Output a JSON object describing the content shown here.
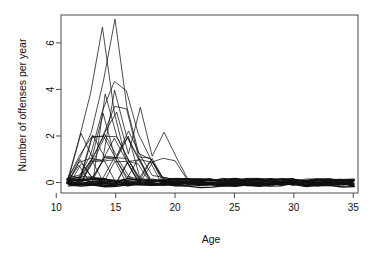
{
  "chart_data": {
    "type": "line",
    "title": "",
    "subtitle": "",
    "xlabel": "Age",
    "ylabel": "Number of offenses per year",
    "xlim": [
      10.4,
      35.4
    ],
    "ylim": [
      -0.45,
      7.2
    ],
    "xticks": [
      10,
      15,
      20,
      25,
      30,
      35
    ],
    "xtick_labels": [
      "10",
      "15",
      "20",
      "25",
      "30",
      "35"
    ],
    "yticks": [
      0,
      2,
      4,
      6
    ],
    "ytick_labels": [
      "0",
      "2",
      "4",
      "6"
    ],
    "grid": false,
    "legend": false,
    "legend_position": "none",
    "line_color": "#111111",
    "background_color": "#ffffff",
    "frame_color": "#4d4d4d",
    "note": "Spaghetti plot of individual offending trajectories; x = age in years, y = number of offenses per year, jittered slightly around integer values.",
    "x": [
      11,
      12,
      13,
      14,
      15,
      16,
      17,
      18,
      19,
      20,
      21,
      22,
      23,
      24,
      25,
      26,
      27,
      28,
      29,
      30,
      31,
      32,
      33,
      34,
      35
    ],
    "series": [
      {
        "name": "case-01",
        "values": [
          0.12,
          1.9,
          3.9,
          6.8,
          3.1,
          1.0,
          0.9,
          0.1,
          0.05,
          0.0,
          0.02,
          0.0,
          0.04,
          0.0,
          0.02,
          0.0,
          0.03,
          0.0,
          0.01,
          0.0,
          0.02,
          0.0,
          0.03,
          0.0,
          0.02
        ]
      },
      {
        "name": "case-02",
        "values": [
          0.08,
          0.9,
          2.0,
          4.2,
          6.9,
          3.2,
          1.1,
          0.9,
          0.1,
          0.05,
          0.0,
          0.02,
          0.0,
          0.03,
          0.0,
          0.01,
          0.0,
          0.02,
          0.0,
          0.03,
          0.0,
          0.02,
          0.0,
          0.01,
          0.0
        ]
      },
      {
        "name": "case-03",
        "values": [
          0.05,
          0.2,
          1.1,
          3.0,
          4.3,
          3.9,
          2.0,
          1.0,
          0.2,
          0.05,
          0.0,
          0.0,
          0.02,
          0.0,
          0.01,
          0.0,
          0.0,
          0.02,
          0.0,
          0.0,
          0.01,
          0.0,
          0.0,
          0.02,
          0.0
        ]
      },
      {
        "name": "case-04",
        "values": [
          0.0,
          1.0,
          1.8,
          1.9,
          3.2,
          3.1,
          1.0,
          1.0,
          0.05,
          0.0,
          0.0,
          0.01,
          0.0,
          0.0,
          0.02,
          0.0,
          0.0,
          0.0,
          0.01,
          0.0,
          0.0,
          0.0,
          0.02,
          0.0,
          0.0
        ]
      },
      {
        "name": "case-05",
        "values": [
          0.15,
          2.0,
          1.0,
          2.1,
          2.9,
          1.1,
          3.1,
          1.0,
          2.1,
          1.0,
          0.05,
          0.0,
          0.0,
          0.0,
          0.0,
          0.01,
          0.0,
          0.0,
          0.0,
          0.0,
          0.0,
          0.01,
          0.0,
          0.0,
          0.0
        ]
      },
      {
        "name": "case-06",
        "values": [
          0.0,
          0.1,
          2.0,
          2.0,
          1.0,
          2.0,
          1.0,
          0.9,
          1.0,
          0.9,
          0.1,
          0.0,
          0.0,
          0.0,
          0.0,
          0.0,
          0.0,
          0.0,
          0.0,
          0.0,
          0.0,
          0.0,
          0.0,
          0.0,
          0.0
        ]
      },
      {
        "name": "case-07",
        "values": [
          0.1,
          0.9,
          0.2,
          3.9,
          2.0,
          1.0,
          0.1,
          1.0,
          0.0,
          0.1,
          0.0,
          0.0,
          0.0,
          0.0,
          0.0,
          0.0,
          0.0,
          0.0,
          0.0,
          0.0,
          0.0,
          0.0,
          0.0,
          0.0,
          0.0
        ]
      },
      {
        "name": "case-08",
        "values": [
          0.0,
          0.1,
          1.0,
          1.0,
          4.0,
          2.0,
          1.0,
          0.1,
          0.0,
          0.0,
          0.0,
          0.0,
          0.0,
          0.0,
          0.0,
          0.0,
          0.0,
          0.0,
          0.0,
          0.0,
          0.0,
          0.0,
          0.0,
          0.0,
          0.0
        ]
      },
      {
        "name": "case-09",
        "values": [
          0.2,
          0.1,
          1.0,
          2.0,
          1.0,
          2.1,
          1.0,
          0.2,
          0.1,
          0.0,
          0.0,
          0.0,
          0.0,
          0.0,
          0.0,
          0.0,
          0.0,
          0.0,
          0.0,
          0.0,
          0.0,
          0.0,
          0.0,
          0.0,
          0.0
        ]
      },
      {
        "name": "case-10",
        "values": [
          0.0,
          0.9,
          1.1,
          1.0,
          2.0,
          1.0,
          0.1,
          1.0,
          0.0,
          0.0,
          0.0,
          0.0,
          0.0,
          0.0,
          0.0,
          0.0,
          0.0,
          0.0,
          0.0,
          0.0,
          0.0,
          0.0,
          0.0,
          0.0,
          0.0
        ]
      },
      {
        "name": "case-11",
        "values": [
          0.1,
          0.2,
          0.9,
          2.9,
          1.0,
          0.1,
          1.0,
          0.1,
          0.0,
          0.0,
          0.0,
          0.0,
          0.0,
          0.0,
          0.0,
          0.0,
          0.0,
          0.0,
          0.0,
          0.0,
          0.0,
          0.0,
          0.0,
          0.0,
          0.0
        ]
      },
      {
        "name": "case-12",
        "values": [
          0.0,
          1.0,
          0.1,
          1.0,
          1.1,
          1.0,
          0.1,
          0.0,
          0.1,
          0.0,
          0.0,
          0.0,
          0.0,
          0.0,
          0.0,
          0.0,
          0.0,
          0.0,
          0.0,
          0.0,
          0.0,
          0.0,
          0.0,
          0.0,
          0.0
        ]
      },
      {
        "name": "case-13",
        "values": [
          0.15,
          0.1,
          2.0,
          1.0,
          1.0,
          1.9,
          0.1,
          0.9,
          0.0,
          0.1,
          0.0,
          0.0,
          0.0,
          0.0,
          0.0,
          0.0,
          0.0,
          0.0,
          0.0,
          0.0,
          0.0,
          0.0,
          0.0,
          0.0,
          0.0
        ]
      },
      {
        "name": "case-14",
        "values": [
          0.0,
          0.1,
          0.9,
          2.0,
          2.0,
          1.0,
          0.0,
          0.1,
          0.0,
          0.0,
          0.0,
          0.0,
          0.0,
          0.0,
          0.0,
          0.0,
          0.0,
          0.0,
          0.0,
          0.0,
          0.0,
          0.0,
          0.0,
          0.0,
          0.0
        ]
      },
      {
        "name": "case-15",
        "values": [
          0.1,
          0.0,
          1.0,
          1.0,
          0.1,
          1.0,
          1.0,
          0.0,
          0.0,
          0.0,
          0.0,
          0.0,
          0.0,
          0.0,
          0.0,
          0.0,
          0.0,
          0.0,
          0.0,
          0.0,
          0.0,
          0.0,
          0.0,
          0.0,
          0.0
        ]
      },
      {
        "name": "case-16",
        "values": [
          0.0,
          0.1,
          0.1,
          1.0,
          1.0,
          0.1,
          0.0,
          0.0,
          0.0,
          0.0,
          0.0,
          0.0,
          0.0,
          0.0,
          0.0,
          0.0,
          0.0,
          0.0,
          0.0,
          0.0,
          0.0,
          0.0,
          0.0,
          0.0,
          0.0
        ]
      },
      {
        "name": "case-17",
        "values": [
          0.1,
          0.9,
          0.1,
          0.1,
          1.0,
          1.0,
          0.1,
          0.0,
          0.0,
          0.0,
          0.0,
          0.0,
          0.0,
          0.0,
          0.0,
          0.0,
          0.0,
          0.0,
          0.0,
          0.0,
          0.0,
          0.0,
          0.0,
          0.0,
          0.0
        ]
      },
      {
        "name": "case-18",
        "values": [
          0.0,
          0.0,
          1.0,
          0.1,
          0.1,
          1.0,
          0.0,
          0.0,
          0.0,
          0.0,
          0.0,
          0.0,
          0.0,
          0.0,
          0.0,
          0.0,
          0.0,
          0.0,
          0.0,
          0.0,
          0.0,
          0.0,
          0.0,
          0.0,
          0.0
        ]
      },
      {
        "name": "case-19",
        "values": [
          0.05,
          0.1,
          0.0,
          1.0,
          1.0,
          0.0,
          0.1,
          0.0,
          0.0,
          0.0,
          0.0,
          0.0,
          0.0,
          0.0,
          0.0,
          0.0,
          0.0,
          0.0,
          0.0,
          0.0,
          0.0,
          0.0,
          0.0,
          0.0,
          0.0
        ]
      },
      {
        "name": "case-20",
        "values": [
          0.0,
          0.1,
          0.1,
          0.0,
          1.0,
          0.1,
          0.0,
          0.0,
          0.0,
          0.0,
          0.0,
          0.0,
          0.0,
          0.0,
          0.0,
          0.0,
          0.0,
          0.0,
          0.0,
          0.0,
          0.0,
          0.0,
          0.0,
          0.0,
          0.0
        ]
      },
      {
        "name": "case-21",
        "values": [
          0.1,
          0.0,
          0.1,
          0.1,
          0.0,
          0.1,
          0.0,
          0.0,
          0.0,
          0.0,
          0.0,
          0.0,
          0.0,
          0.0,
          0.0,
          0.0,
          0.0,
          0.0,
          0.0,
          0.0,
          0.0,
          0.0,
          0.0,
          0.0,
          0.0
        ]
      },
      {
        "name": "case-22",
        "values": [
          0.0,
          0.0,
          0.0,
          0.1,
          0.1,
          0.0,
          0.0,
          0.0,
          0.0,
          0.0,
          0.0,
          0.0,
          0.0,
          0.0,
          0.0,
          0.0,
          0.0,
          0.0,
          0.0,
          0.0,
          0.0,
          0.0,
          0.0,
          0.0,
          0.0
        ]
      },
      {
        "name": "case-23",
        "values": [
          0.05,
          0.05,
          0.05,
          0.0,
          0.0,
          0.05,
          0.0,
          0.0,
          0.0,
          0.0,
          0.0,
          0.0,
          0.0,
          0.0,
          0.0,
          0.0,
          0.0,
          0.0,
          0.0,
          0.0,
          0.0,
          0.0,
          0.0,
          0.0,
          0.0
        ]
      },
      {
        "name": "case-24",
        "values": [
          0.0,
          0.0,
          0.0,
          0.0,
          0.0,
          0.0,
          0.0,
          0.0,
          0.0,
          0.0,
          0.0,
          0.0,
          0.0,
          0.0,
          0.0,
          0.0,
          0.0,
          0.0,
          0.0,
          0.0,
          0.0,
          0.0,
          0.0,
          0.0,
          0.0
        ]
      },
      {
        "name": "case-25",
        "values": [
          0.0,
          0.0,
          0.0,
          0.0,
          0.0,
          0.0,
          0.0,
          0.0,
          0.0,
          0.0,
          0.0,
          0.0,
          0.0,
          0.0,
          0.0,
          0.0,
          0.0,
          0.0,
          0.0,
          0.0,
          0.0,
          0.0,
          0.0,
          0.0,
          0.0
        ]
      },
      {
        "name": "case-26",
        "values": [
          0.0,
          0.0,
          0.0,
          0.0,
          0.0,
          0.0,
          0.0,
          0.0,
          0.0,
          0.0,
          0.0,
          0.0,
          0.0,
          0.0,
          0.0,
          0.0,
          0.0,
          0.0,
          0.0,
          0.0,
          0.0,
          0.0,
          0.0,
          0.0,
          0.0
        ]
      },
      {
        "name": "case-27",
        "values": [
          0.0,
          0.0,
          0.0,
          0.0,
          0.0,
          0.0,
          0.0,
          0.0,
          0.0,
          0.0,
          0.0,
          0.0,
          0.0,
          0.0,
          0.0,
          0.0,
          0.0,
          0.0,
          0.0,
          0.0,
          0.0,
          0.0,
          0.0,
          0.0,
          0.0
        ]
      },
      {
        "name": "case-28",
        "values": [
          0.0,
          0.0,
          0.0,
          0.0,
          0.0,
          0.0,
          0.0,
          0.0,
          0.0,
          0.0,
          0.0,
          0.0,
          0.0,
          0.0,
          0.0,
          0.0,
          0.0,
          0.0,
          0.0,
          0.0,
          0.0,
          0.0,
          0.0,
          0.0,
          0.0
        ]
      },
      {
        "name": "case-29",
        "values": [
          0.0,
          0.0,
          0.0,
          0.0,
          0.0,
          0.0,
          0.0,
          0.0,
          0.0,
          0.0,
          0.0,
          0.0,
          0.0,
          0.0,
          0.0,
          0.0,
          0.0,
          0.0,
          0.0,
          0.0,
          0.0,
          0.0,
          0.0,
          0.0,
          0.0
        ]
      },
      {
        "name": "case-30",
        "values": [
          0.0,
          0.0,
          0.0,
          0.0,
          0.0,
          0.0,
          0.0,
          0.0,
          0.0,
          0.0,
          0.0,
          0.0,
          0.0,
          0.0,
          0.0,
          0.0,
          0.0,
          0.0,
          0.0,
          0.0,
          0.0,
          0.0,
          0.0,
          0.0,
          0.0
        ]
      }
    ]
  }
}
